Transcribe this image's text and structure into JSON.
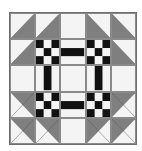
{
  "quilt": {
    "title": "",
    "grid_size": 5,
    "colors": {
      "light": "#f4f4f4",
      "gray": "#7f7f7f",
      "dark": "#111111",
      "grid_line": "#8a8a8a"
    },
    "layout": [
      [
        "hst-br",
        "hst-br",
        "plain",
        "hst-bl",
        "hst-bl"
      ],
      [
        "hst-br",
        "ninepatch",
        "bar-h",
        "ninepatch",
        "hst-bl"
      ],
      [
        "plain",
        "bar-v",
        "plain",
        "bar-v",
        "plain"
      ],
      [
        "hst-tr",
        "ninepatch",
        "bar-h",
        "ninepatch",
        "hst-tl"
      ],
      [
        "hst-tr",
        "hst-tr",
        "plain",
        "hst-tl",
        "hst-tl"
      ]
    ],
    "ninepatch_pattern": [
      [
        "dark",
        "light",
        "dark"
      ],
      [
        "light",
        "dark",
        "light"
      ],
      [
        "dark",
        "light",
        "dark"
      ]
    ]
  }
}
